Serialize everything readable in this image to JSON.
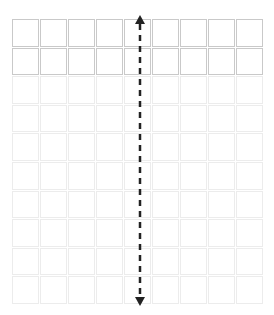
{
  "diagram": {
    "title": "",
    "grid": {
      "columns": 9,
      "rows": 10,
      "highlighted_rows": 2,
      "colors": {
        "highlighted_border": "#c9c9c9",
        "faint_border": "#ececec",
        "cell_fill": "#ffffff"
      }
    },
    "arrow": {
      "type": "double-headed",
      "style": "dashed",
      "orientation": "vertical",
      "column_index": 4,
      "span_rows": "all",
      "color": "#222222"
    }
  }
}
